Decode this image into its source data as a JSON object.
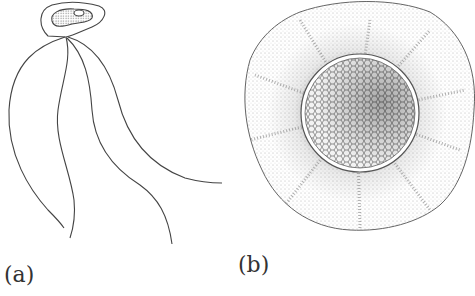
{
  "panels": [
    {
      "id": "a",
      "label": "(a)",
      "subject": "flagellated cell with four flagella"
    },
    {
      "id": "b",
      "label": "(b)",
      "subject": "spherical cyst with reticulate central body and radiating striations"
    }
  ],
  "colors": {
    "line": "#444444",
    "stipple": "#555555",
    "background": "#ffffff"
  }
}
